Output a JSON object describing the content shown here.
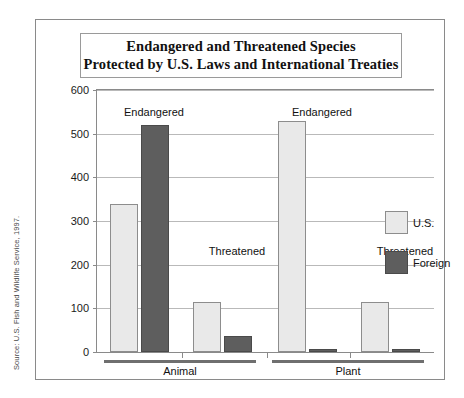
{
  "figure": {
    "title_line_1": "Endangered and Threatened Species",
    "title_line_2": "Protected by U.S. Laws and International Treaties",
    "source_note": "Source: U.S. Fish and Wildlife Service, 1997."
  },
  "chart_data": {
    "type": "bar",
    "title": "Endangered and Threatened Species Protected by U.S. Laws and International Treaties",
    "xlabel": "",
    "ylabel": "",
    "ylim": [
      0,
      600
    ],
    "yticks": [
      0,
      100,
      200,
      300,
      400,
      500,
      600
    ],
    "ytick_labels": [
      "0",
      "100",
      "200",
      "300",
      "400",
      "500",
      "600"
    ],
    "grid": true,
    "legend_position": "right",
    "legend": [
      "U.S.",
      "Foreign"
    ],
    "groups": [
      "Animal",
      "Plant"
    ],
    "categories": [
      "Endangered",
      "Threatened",
      "Endangered",
      "Threatened"
    ],
    "series": [
      {
        "name": "U.S.",
        "color": "#e9e9e9",
        "values": [
          340,
          115,
          530,
          115
        ]
      },
      {
        "name": "Foreign",
        "color": "#5e5e5e",
        "values": [
          520,
          37,
          3,
          8
        ]
      }
    ],
    "bars": [
      {
        "group": "Animal",
        "category": "Endangered",
        "series": "U.S.",
        "value": 340
      },
      {
        "group": "Animal",
        "category": "Endangered",
        "series": "Foreign",
        "value": 520
      },
      {
        "group": "Animal",
        "category": "Threatened",
        "series": "U.S.",
        "value": 115
      },
      {
        "group": "Animal",
        "category": "Threatened",
        "series": "Foreign",
        "value": 37
      },
      {
        "group": "Plant",
        "category": "Endangered",
        "series": "U.S.",
        "value": 530
      },
      {
        "group": "Plant",
        "category": "Endangered",
        "series": "Foreign",
        "value": 3
      },
      {
        "group": "Plant",
        "category": "Threatened",
        "series": "U.S.",
        "value": 115
      },
      {
        "group": "Plant",
        "category": "Threatened",
        "series": "Foreign",
        "value": 8
      }
    ],
    "annotations": [
      {
        "text": "Endangered",
        "group": "Animal"
      },
      {
        "text": "Threatened",
        "group": "Animal"
      },
      {
        "text": "Endangered",
        "group": "Plant"
      },
      {
        "text": "Threatened",
        "group": "Plant"
      }
    ]
  }
}
